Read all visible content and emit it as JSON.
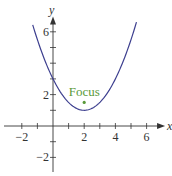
{
  "chart_data": {
    "type": "line",
    "title": "",
    "xlabel": "x",
    "ylabel": "y",
    "xlim": [
      -3,
      7
    ],
    "ylim": [
      -3,
      7
    ],
    "grid": false,
    "x_ticks": [
      -2,
      -1,
      1,
      2,
      3,
      4,
      5,
      6
    ],
    "x_tick_labels": [
      {
        "value": -2,
        "label": "−2"
      },
      {
        "value": 2,
        "label": "2"
      },
      {
        "value": 4,
        "label": "4"
      },
      {
        "value": 6,
        "label": "6"
      }
    ],
    "y_ticks": [
      -2,
      -1,
      1,
      2,
      3,
      4,
      5,
      6
    ],
    "y_tick_labels": [
      {
        "value": -2,
        "label": "−2"
      },
      {
        "value": 2,
        "label": "2"
      },
      {
        "value": 6,
        "label": "6"
      }
    ],
    "series": [
      {
        "name": "parabola",
        "equation": "y = (x - 2)^2 / 2 + 1",
        "x_range": [
          -1.3,
          5.35
        ],
        "color": "#3d3f8f"
      }
    ],
    "points": [
      {
        "name": "focus",
        "x": 2,
        "y": 1.5,
        "label": "Focus",
        "color": "#5a9a3a"
      }
    ],
    "axis_color": "#333333"
  }
}
